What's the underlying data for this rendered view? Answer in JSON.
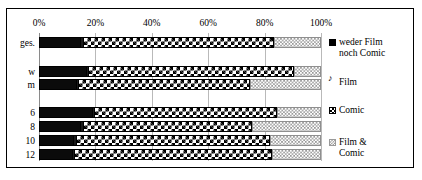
{
  "chart_data": {
    "type": "bar",
    "orientation": "horizontal",
    "stacked": true,
    "normalized_percent": true,
    "title": "",
    "subtitle": "",
    "xlabel": "",
    "ylabel": "",
    "xlim": [
      0,
      100
    ],
    "x_tick_labels": [
      "0%",
      "20%",
      "40%",
      "60%",
      "80%",
      "100%"
    ],
    "x_tick_values": [
      0,
      20,
      40,
      60,
      80,
      100
    ],
    "grid": true,
    "grid_axis": "x",
    "legend_position": "right",
    "categories": [
      "ges.",
      "w",
      "m",
      "6",
      "8",
      "10",
      "12"
    ],
    "series": [
      {
        "name": "weder Film noch Comic",
        "pattern": "solid-black",
        "color": "#000000",
        "values": [
          15.0,
          17.0,
          13.5,
          19.0,
          15.0,
          12.5,
          12.0
        ]
      },
      {
        "name": "Film",
        "pattern": "thin-dark",
        "color": "#1a1a1a",
        "values": [
          0.5,
          0.5,
          0.5,
          0.5,
          0.5,
          0.5,
          0.5
        ]
      },
      {
        "name": "Comic",
        "pattern": "checkerboard",
        "color": "#000000",
        "values": [
          68.0,
          73.0,
          61.0,
          65.0,
          60.0,
          69.0,
          70.0
        ]
      },
      {
        "name": "Film & Comic",
        "pattern": "fine-dotted-grey",
        "color": "#9a9a9a",
        "values": [
          16.5,
          9.5,
          25.0,
          15.5,
          24.5,
          18.0,
          17.5
        ]
      }
    ],
    "legend_entries": [
      "weder Film\nnoch Comic",
      "Film",
      "Comic",
      "Film &\nComic"
    ]
  },
  "frame": {
    "border_color": "#000000",
    "background_color": "#ffffff"
  }
}
